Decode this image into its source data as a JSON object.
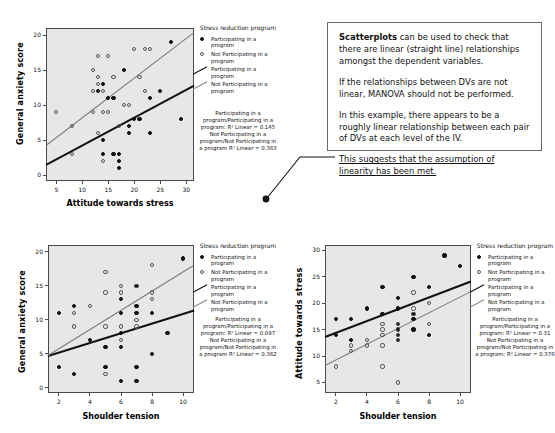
{
  "callout": {
    "paragraphs": [
      {
        "bold": "Scatterplots",
        "rest": " can be used to check that there are linear (straight line) relationships amongst the dependent variables."
      },
      {
        "bold": "",
        "rest": "If the relationships between DVs are not linear, MANOVA should not be performed."
      },
      {
        "bold": "",
        "rest": "In this example, there appears to be a roughly linear relationship between each pair of DVs at each level of the IV."
      },
      {
        "bold": "",
        "rest": "This suggests that the assumption of linearity has been met.",
        "underline": true
      }
    ]
  },
  "legend_common": {
    "title": "Stress reduction program",
    "entries": [
      {
        "label": "Participating in a program",
        "marker": "filled-dot"
      },
      {
        "label": "Not Participating in a program",
        "marker": "open-dot"
      },
      {
        "label": "Participating in a program",
        "marker": "dark-line"
      },
      {
        "label": "Not Participating in a program",
        "marker": "gray-line"
      }
    ]
  },
  "chart_data": [
    {
      "id": "anxiety-vs-attitude",
      "type": "scatter",
      "title": "",
      "xlabel": "Attitude towards stress",
      "ylabel": "General anxiety score",
      "xlim": [
        3,
        31.5
      ],
      "ylim": [
        -0.8,
        21
      ],
      "xticks": [
        5,
        10,
        15,
        20,
        25,
        30
      ],
      "yticks": [
        0,
        5,
        10,
        15,
        20
      ],
      "grid": false,
      "legend_position": "right",
      "r2_text": "Participating in a program/Participating in a program: R² Linear = 0.145 Not Participating in a program/Not Participating in a program R² Linear = 0.363",
      "r2_values": {
        "participating": 0.145,
        "not_participating": 0.363
      },
      "series": [
        {
          "name": "Participating in a program",
          "marker": "filled-dot",
          "fit": {
            "x1": 3,
            "y1": 1.6,
            "x2": 31.5,
            "y2": 12.9,
            "color": "#111111"
          },
          "points": [
            [
              13,
              12
            ],
            [
              14,
              13
            ],
            [
              14,
              5
            ],
            [
              14,
              3
            ],
            [
              15,
              11
            ],
            [
              16,
              11
            ],
            [
              16,
              3
            ],
            [
              17,
              3
            ],
            [
              17,
              2
            ],
            [
              17,
              1
            ],
            [
              18,
              15
            ],
            [
              19,
              7
            ],
            [
              19,
              6
            ],
            [
              20,
              8
            ],
            [
              21,
              8
            ],
            [
              23,
              11
            ],
            [
              23,
              6
            ],
            [
              25,
              12
            ],
            [
              27,
              19
            ],
            [
              29,
              8
            ]
          ]
        },
        {
          "name": "Not Participating in a program",
          "marker": "open-dot",
          "fit": {
            "x1": 3,
            "y1": 4.3,
            "x2": 31.5,
            "y2": 20.4,
            "color": "#7a7a7a"
          },
          "points": [
            [
              5,
              9
            ],
            [
              8,
              7
            ],
            [
              8,
              3
            ],
            [
              12,
              12
            ],
            [
              12,
              15
            ],
            [
              12,
              9
            ],
            [
              13,
              17
            ],
            [
              13,
              14
            ],
            [
              13,
              13
            ],
            [
              13,
              6
            ],
            [
              14,
              12
            ],
            [
              14,
              9
            ],
            [
              14,
              2
            ],
            [
              15,
              17
            ],
            [
              15,
              9
            ],
            [
              16,
              14
            ],
            [
              17,
              7
            ],
            [
              18,
              10
            ],
            [
              19,
              10
            ],
            [
              20,
              18
            ],
            [
              21,
              14
            ],
            [
              22,
              12
            ],
            [
              22,
              18
            ],
            [
              23,
              18
            ]
          ]
        }
      ]
    },
    {
      "id": "anxiety-vs-shoulder",
      "type": "scatter",
      "title": "",
      "xlabel": "Shoulder tension",
      "ylabel": "General anxiety score",
      "xlim": [
        1.3,
        10.7
      ],
      "ylim": [
        -0.8,
        21
      ],
      "xticks": [
        2,
        4,
        6,
        8,
        10
      ],
      "yticks": [
        0,
        5,
        10,
        15,
        20
      ],
      "grid": false,
      "legend_position": "right",
      "r2_text": "Participating in a program/Participating in a program: R² Linear = 0.097 Not Participating in a program/Not Participating in a program R² Linear = 0.362",
      "r2_values": {
        "participating": 0.097,
        "not_participating": 0.362
      },
      "series": [
        {
          "name": "Participating in a program",
          "marker": "filled-dot",
          "fit": {
            "x1": 1.3,
            "y1": 4.8,
            "x2": 10.7,
            "y2": 11.5,
            "color": "#111111"
          },
          "points": [
            [
              2,
              11
            ],
            [
              2,
              3
            ],
            [
              3,
              12
            ],
            [
              3,
              2
            ],
            [
              4,
              7
            ],
            [
              5,
              6
            ],
            [
              5,
              3
            ],
            [
              6,
              13
            ],
            [
              6,
              11
            ],
            [
              6,
              8
            ],
            [
              6,
              6
            ],
            [
              6,
              1
            ],
            [
              7,
              15
            ],
            [
              7,
              12
            ],
            [
              7,
              11
            ],
            [
              7,
              3
            ],
            [
              7,
              1
            ],
            [
              8,
              11
            ],
            [
              8,
              5
            ],
            [
              9,
              8
            ],
            [
              10,
              19
            ]
          ]
        },
        {
          "name": "Not Participating in a program",
          "marker": "open-dot",
          "fit": {
            "x1": 1.3,
            "y1": 4.8,
            "x2": 10.7,
            "y2": 18.1,
            "color": "#7a7a7a"
          },
          "points": [
            [
              3,
              11
            ],
            [
              3,
              9
            ],
            [
              4,
              12
            ],
            [
              5,
              17
            ],
            [
              5,
              14
            ],
            [
              5,
              9
            ],
            [
              5,
              2
            ],
            [
              6,
              15
            ],
            [
              6,
              14
            ],
            [
              6,
              9
            ],
            [
              6,
              7
            ],
            [
              7,
              15
            ],
            [
              7,
              10
            ],
            [
              7,
              9
            ],
            [
              8,
              18
            ],
            [
              8,
              14
            ],
            [
              8,
              13
            ]
          ]
        }
      ]
    },
    {
      "id": "attitude-vs-shoulder",
      "type": "scatter",
      "title": "",
      "xlabel": "Shoulder tension",
      "ylabel": "Attitude towards stress",
      "xlim": [
        1.3,
        10.7
      ],
      "ylim": [
        3,
        31
      ],
      "xticks": [
        2,
        4,
        6,
        8,
        10
      ],
      "yticks": [
        5,
        10,
        15,
        20,
        25,
        30
      ],
      "grid": false,
      "legend_position": "right",
      "r2_text": "Participating in a program/Participating in a program: R² Linear = 0.31 Not Participating in a program/Not Participating in a program: R² Linear = 0.376",
      "r2_values": {
        "participating": 0.31,
        "not_participating": 0.376
      },
      "series": [
        {
          "name": "Participating in a program",
          "marker": "filled-dot",
          "fit": {
            "x1": 1.3,
            "y1": 13.7,
            "x2": 10.7,
            "y2": 24.2,
            "color": "#111111"
          },
          "points": [
            [
              2,
              17
            ],
            [
              2,
              14
            ],
            [
              3,
              17
            ],
            [
              3,
              13
            ],
            [
              4,
              19
            ],
            [
              5,
              23
            ],
            [
              5,
              18
            ],
            [
              6,
              21
            ],
            [
              6,
              19
            ],
            [
              6,
              16
            ],
            [
              6,
              15
            ],
            [
              6,
              14
            ],
            [
              6,
              13
            ],
            [
              7,
              25
            ],
            [
              7,
              18
            ],
            [
              7,
              17
            ],
            [
              7,
              15
            ],
            [
              8,
              23
            ],
            [
              8,
              14
            ],
            [
              9,
              29
            ],
            [
              10,
              27
            ]
          ]
        },
        {
          "name": "Not Participating in a program",
          "marker": "open-dot",
          "fit": {
            "x1": 1.3,
            "y1": 8.3,
            "x2": 10.7,
            "y2": 22.3,
            "color": "#7a7a7a"
          },
          "points": [
            [
              2,
              8
            ],
            [
              3,
              12
            ],
            [
              3,
              11
            ],
            [
              4,
              13
            ],
            [
              4,
              12
            ],
            [
              5,
              16
            ],
            [
              5,
              15
            ],
            [
              5,
              14
            ],
            [
              5,
              12
            ],
            [
              5,
              8
            ],
            [
              6,
              16
            ],
            [
              6,
              15
            ],
            [
              6,
              14
            ],
            [
              6,
              13
            ],
            [
              6,
              5
            ],
            [
              7,
              22
            ],
            [
              7,
              19
            ],
            [
              7,
              18
            ],
            [
              8,
              20
            ],
            [
              8,
              16
            ]
          ]
        }
      ]
    }
  ]
}
